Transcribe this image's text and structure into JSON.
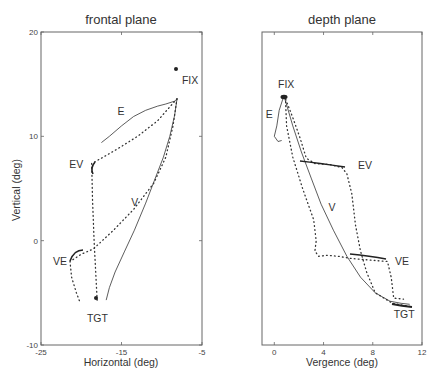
{
  "chart_data": [
    {
      "type": "line",
      "title": "frontal plane",
      "xlabel": "Horizontal (deg)",
      "ylabel": "Vertical (deg)",
      "xlim": [
        -25,
        -5
      ],
      "ylim": [
        -10,
        20
      ],
      "xticks": [
        "-25",
        "-15",
        "-5"
      ],
      "yticks": [
        "-10",
        "0",
        "10",
        "20"
      ],
      "grid": false,
      "legend": null,
      "annotations": [
        {
          "text": "FIX",
          "x": -7.5,
          "y": 15.0
        },
        {
          "text": "E",
          "x": -15.5,
          "y": 12.0
        },
        {
          "text": "EV",
          "x": -21.5,
          "y": 7.0
        },
        {
          "text": "V",
          "x": -13.8,
          "y": 3.3
        },
        {
          "text": "VE",
          "x": -23.5,
          "y": -2.3
        },
        {
          "text": "TGT",
          "x": -19.3,
          "y": -7.8
        }
      ],
      "series": [
        {
          "name": "E (solid)",
          "style": "solid",
          "x": [
            -17.5,
            -16.5,
            -15,
            -13.5,
            -12,
            -10.5,
            -9.5,
            -8.3,
            -8.1
          ],
          "y": [
            9.4,
            10.0,
            11.0,
            11.9,
            12.5,
            12.9,
            13.1,
            13.4,
            13.6
          ]
        },
        {
          "name": "V (solid)",
          "style": "solid",
          "x": [
            -8.1,
            -8.4,
            -9.0,
            -9.8,
            -10.9,
            -12.0,
            -13.4,
            -14.6,
            -15.8,
            -16.5,
            -16.9
          ],
          "y": [
            13.6,
            12.0,
            10.0,
            8.0,
            5.8,
            3.6,
            1.0,
            -1.0,
            -3.0,
            -4.5,
            -5.7
          ]
        },
        {
          "name": "FIX-EV-TGT (dotted)",
          "style": "dotted",
          "x": [
            -8.1,
            -10.5,
            -13,
            -15.5,
            -17.5,
            -18.7,
            -18.6,
            -18.4,
            -18.2,
            -18.0
          ],
          "y": [
            13.6,
            11.5,
            10.0,
            8.8,
            7.9,
            7.4,
            4.0,
            0.0,
            -3.0,
            -6.0
          ]
        },
        {
          "name": "FIX-VE-TGT (dotted)",
          "style": "dotted",
          "x": [
            -8.1,
            -8.6,
            -9.5,
            -11,
            -13.5,
            -16,
            -18.5,
            -20.0,
            -21.4,
            -21.2,
            -20.6,
            -20.1
          ],
          "y": [
            13.6,
            11.0,
            8.0,
            5.5,
            3.0,
            1.0,
            -0.8,
            -1.3,
            -2.0,
            -3.5,
            -5.0,
            -6.0
          ]
        }
      ]
    },
    {
      "type": "line",
      "title": "depth plane",
      "xlabel": "Vergence (deg)",
      "ylabel": "",
      "xlim": [
        -1,
        12
      ],
      "ylim": [
        -10,
        20
      ],
      "xticks": [
        "0",
        "4",
        "8",
        "12"
      ],
      "yticks": [],
      "grid": false,
      "legend": null,
      "annotations": [
        {
          "text": "FIX",
          "x": 0.3,
          "y": 14.6
        },
        {
          "text": "E",
          "x": -0.7,
          "y": 11.8
        },
        {
          "text": "EV",
          "x": 6.8,
          "y": 6.9
        },
        {
          "text": "V",
          "x": 4.4,
          "y": 2.8
        },
        {
          "text": "VE",
          "x": 9.8,
          "y": -2.3
        },
        {
          "text": "TGT",
          "x": 9.7,
          "y": -7.4
        }
      ],
      "series": [
        {
          "name": "E (solid)",
          "style": "solid",
          "x": [
            0.7,
            0.4,
            0.2,
            0.0,
            0.3,
            0.6
          ],
          "y": [
            13.6,
            12.5,
            11.0,
            10.0,
            9.5,
            9.6
          ]
        },
        {
          "name": "V (solid)",
          "style": "solid",
          "x": [
            0.8,
            1.5,
            2.2,
            3.0,
            3.8,
            4.8,
            5.9,
            7.0,
            8.2,
            9.4,
            10.3,
            11.0
          ],
          "y": [
            13.8,
            11.0,
            8.5,
            6.0,
            3.5,
            1.0,
            -1.5,
            -3.5,
            -5.0,
            -5.8,
            -6.0,
            -6.1
          ]
        },
        {
          "name": "FIX-EV-TGT",
          "style": "dotted_then_solid",
          "x": [
            0.8,
            1.5,
            2.1,
            2.6,
            3.3,
            4.5,
            5.5,
            5.9,
            6.3,
            6.6,
            7.0,
            7.5,
            8.2,
            9.6,
            11.0
          ],
          "y": [
            13.9,
            11.8,
            9.8,
            7.9,
            7.4,
            7.3,
            7.0,
            6.4,
            4.5,
            1.5,
            -1.0,
            -3.0,
            -5.0,
            -6.0,
            -6.3
          ]
        },
        {
          "name": "FIX-VE-TGT",
          "style": "dotted_then_solid",
          "x": [
            0.9,
            1.0,
            1.5,
            2.3,
            3.2,
            3.4,
            3.3,
            3.6,
            4.3,
            5.2,
            6.2,
            8.2,
            9.2,
            9.5,
            9.7,
            10.5
          ],
          "y": [
            13.7,
            11.0,
            8.0,
            5.0,
            2.0,
            0.0,
            -1.0,
            -1.5,
            -1.4,
            -1.5,
            -1.7,
            -1.9,
            -2.0,
            -3.5,
            -5.5,
            -5.6
          ]
        }
      ]
    }
  ]
}
